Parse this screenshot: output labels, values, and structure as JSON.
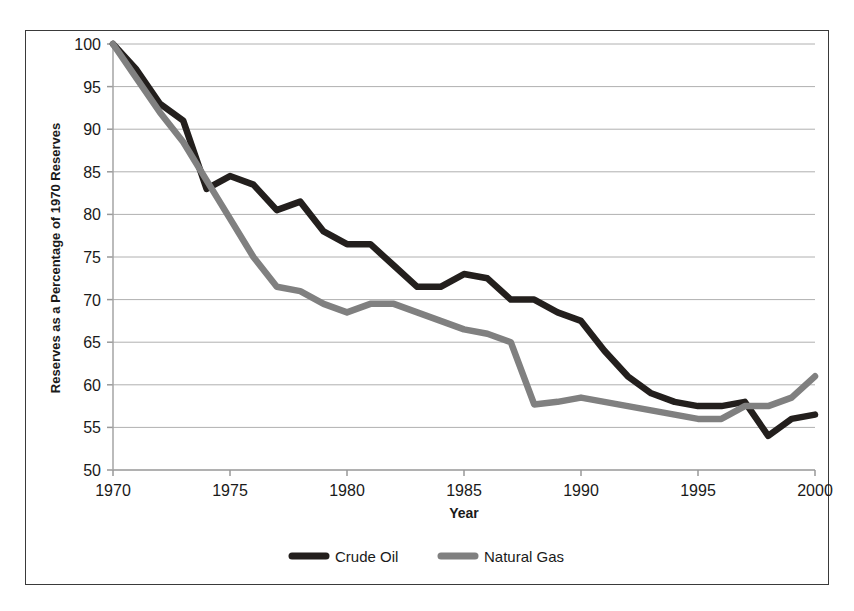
{
  "chart_data": {
    "type": "line",
    "title": "",
    "xlabel": "Year",
    "ylabel": "Reserves as a Percentage of 1970 Reserves",
    "xlim": [
      1970,
      2000
    ],
    "ylim": [
      50,
      100
    ],
    "xticks": [
      1970,
      1975,
      1980,
      1985,
      1990,
      1995,
      2000
    ],
    "yticks": [
      50,
      55,
      60,
      65,
      70,
      75,
      80,
      85,
      90,
      95,
      100
    ],
    "grid": "horizontal",
    "legend_position": "bottom-center",
    "x": [
      1970,
      1971,
      1972,
      1973,
      1974,
      1975,
      1976,
      1977,
      1978,
      1979,
      1980,
      1981,
      1982,
      1983,
      1984,
      1985,
      1986,
      1987,
      1988,
      1989,
      1990,
      1991,
      1992,
      1993,
      1994,
      1995,
      1996,
      1997,
      1998,
      1999,
      2000
    ],
    "series": [
      {
        "name": "Crude Oil",
        "color": "#231f1d",
        "values": [
          100,
          97,
          93,
          91,
          83,
          84.5,
          83.5,
          80.5,
          81.5,
          78,
          76.5,
          76.5,
          74,
          71.5,
          71.5,
          73,
          72.5,
          70,
          70,
          68.5,
          67.5,
          64,
          61,
          59,
          58,
          57.5,
          57.5,
          58,
          54,
          56,
          56.5
        ]
      },
      {
        "name": "Natural Gas",
        "color": "#808080",
        "values": [
          100,
          96,
          92,
          88.5,
          84,
          79.5,
          75,
          71.5,
          71,
          69.5,
          68.5,
          69.5,
          69.5,
          68.5,
          67.5,
          66.5,
          66,
          65,
          57.7,
          58,
          58.5,
          58,
          57.5,
          57,
          56.5,
          56,
          56,
          57.5,
          57.5,
          58.5,
          61
        ]
      }
    ],
    "legend": [
      {
        "label": "Crude Oil",
        "color": "#231f1d"
      },
      {
        "label": "Natural Gas",
        "color": "#808080"
      }
    ]
  },
  "axis": {
    "y_title": "Reserves as a Percentage of 1970 Reserves",
    "x_title": "Year",
    "y_tick_labels": [
      "100",
      "95",
      "90",
      "85",
      "80",
      "75",
      "70",
      "65",
      "60",
      "55",
      "50"
    ],
    "x_tick_labels": [
      "1970",
      "1975",
      "1980",
      "1985",
      "1990",
      "1995",
      "2000"
    ]
  },
  "colors": {
    "crude_oil": "#231f1d",
    "natural_gas": "#808080",
    "gridline": "#b0b0b0",
    "axis": "#999999",
    "frame": "#3a3a3a",
    "text": "#1a1a1a",
    "background": "#ffffff"
  }
}
